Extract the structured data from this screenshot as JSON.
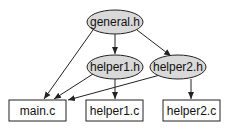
{
  "diagram": {
    "type": "dependency-graph",
    "nodes": [
      {
        "id": "general_h",
        "label": "general.h",
        "shape": "ellipse"
      },
      {
        "id": "helper1_h",
        "label": "helper1.h",
        "shape": "ellipse"
      },
      {
        "id": "helper2_h",
        "label": "helper2.h",
        "shape": "ellipse"
      },
      {
        "id": "main_c",
        "label": "main.c",
        "shape": "box"
      },
      {
        "id": "helper1_c",
        "label": "helper1.c",
        "shape": "box"
      },
      {
        "id": "helper2_c",
        "label": "helper2.c",
        "shape": "box"
      }
    ],
    "edges": [
      {
        "from": "general_h",
        "to": "main_c"
      },
      {
        "from": "general_h",
        "to": "helper1_h"
      },
      {
        "from": "general_h",
        "to": "helper2_h"
      },
      {
        "from": "helper1_h",
        "to": "main_c"
      },
      {
        "from": "helper1_h",
        "to": "helper1_c"
      },
      {
        "from": "helper2_h",
        "to": "main_c"
      },
      {
        "from": "helper2_h",
        "to": "helper2_c"
      }
    ],
    "colors": {
      "header_fill": "#d9d9d9",
      "source_fill": "#ffffff",
      "stroke": "#222222"
    }
  },
  "labels": {
    "general_h": "general.h",
    "helper1_h": "helper1.h",
    "helper2_h": "helper2.h",
    "main_c": "main.c",
    "helper1_c": "helper1.c",
    "helper2_c": "helper2.c"
  }
}
